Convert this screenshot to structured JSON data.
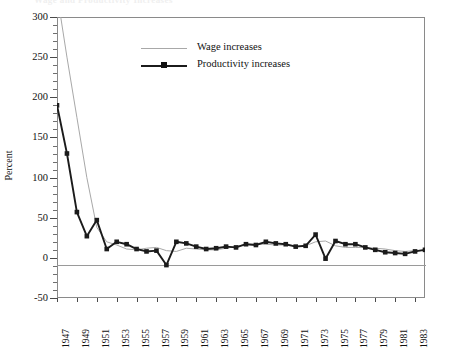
{
  "title": "Wage and Productivity Increases",
  "axis": {
    "ylabel": "Percent",
    "yticks": [
      300,
      250,
      200,
      150,
      100,
      50,
      0,
      -50
    ],
    "ylim": [
      -50,
      300
    ],
    "xlim": [
      1947,
      1984
    ],
    "xticks": [
      1947,
      1949,
      1951,
      1953,
      1955,
      1957,
      1959,
      1961,
      1963,
      1965,
      1967,
      1969,
      1971,
      1973,
      1975,
      1977,
      1979,
      1981,
      1983
    ]
  },
  "legend": {
    "items": [
      {
        "label": "Wage increases",
        "color": "#a8a8a8",
        "marker": "none"
      },
      {
        "label": "Productivity increases",
        "color": "#1b1b1b",
        "marker": "square"
      }
    ]
  },
  "chart_data": {
    "type": "line",
    "title": "Wage and Productivity Increases",
    "xlabel": "",
    "ylabel": "Percent",
    "ylim": [
      -50,
      300
    ],
    "xlim": [
      1947,
      1984
    ],
    "grid": false,
    "legend_position": "upper-center",
    "x": [
      1947,
      1948,
      1949,
      1950,
      1951,
      1952,
      1953,
      1954,
      1955,
      1956,
      1957,
      1958,
      1959,
      1960,
      1961,
      1962,
      1963,
      1964,
      1965,
      1966,
      1967,
      1968,
      1969,
      1970,
      1971,
      1972,
      1973,
      1974,
      1975,
      1976,
      1977,
      1978,
      1979,
      1980,
      1981,
      1982,
      1983,
      1984
    ],
    "series": [
      {
        "name": "Wage increases",
        "color": "#a8a8a8",
        "values": [
          330,
          250,
          175,
          100,
          38,
          20,
          16,
          11,
          10,
          12,
          13,
          9,
          8,
          12,
          11,
          10,
          10,
          12,
          14,
          17,
          17,
          17,
          16,
          16,
          15,
          15,
          20,
          21,
          15,
          13,
          13,
          13,
          12,
          11,
          9,
          8,
          9,
          10
        ]
      },
      {
        "name": "Productivity increases",
        "color": "#1b1b1b",
        "values": [
          190,
          130,
          57,
          27,
          47,
          11,
          20,
          17,
          11,
          8,
          9,
          -9,
          20,
          18,
          14,
          11,
          12,
          14,
          13,
          17,
          16,
          20,
          18,
          17,
          14,
          15,
          29,
          -1,
          21,
          17,
          17,
          13,
          10,
          7,
          6,
          5,
          8,
          10
        ]
      }
    ]
  }
}
